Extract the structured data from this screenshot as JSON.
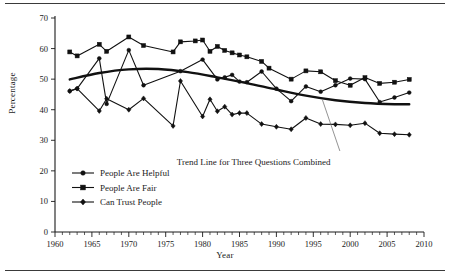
{
  "figure": {
    "rules": [
      "top-rule",
      "bottom-rule"
    ]
  },
  "chart_data": {
    "type": "line",
    "title": "",
    "xlabel": "Year",
    "ylabel": "Percentage",
    "xlim": [
      1960,
      2010
    ],
    "ylim": [
      0,
      70
    ],
    "xticks": [
      1960,
      1965,
      1970,
      1975,
      1980,
      1985,
      1990,
      1995,
      2000,
      2005,
      2010
    ],
    "xtick_labels": [
      "1960",
      "1965",
      "1970",
      "1975",
      "1980",
      "1985",
      "1990",
      "1995",
      "2000",
      "2005",
      "2010"
    ],
    "minor_xtick_step": 1,
    "yticks": [
      0,
      10,
      20,
      30,
      40,
      50,
      60,
      70
    ],
    "ytick_labels": [
      "0",
      "10",
      "20",
      "30",
      "40",
      "50",
      "60",
      "70"
    ],
    "grid": false,
    "legend_position": "lower-left-inside",
    "series": [
      {
        "name": "People Are Helpful",
        "marker": "circle",
        "x": [
          1962,
          1963,
          1966,
          1967,
          1970,
          1972,
          1977,
          1980,
          1982,
          1983,
          1984,
          1985,
          1986,
          1988,
          1990,
          1992,
          1994,
          1996,
          1998,
          2000,
          2002,
          2004,
          2006,
          2008
        ],
        "values": [
          46.1,
          46.9,
          56.8,
          41.9,
          59.5,
          48.0,
          52.6,
          56.4,
          49.9,
          50.6,
          51.4,
          49.2,
          49.0,
          52.5,
          46.9,
          42.8,
          47.6,
          45.9,
          48.0,
          50.2,
          50.0,
          42.5,
          44.0,
          45.6
        ]
      },
      {
        "name": "People Are Fair",
        "marker": "square",
        "x": [
          1962,
          1963,
          1966,
          1967,
          1970,
          1972,
          1976,
          1977,
          1979,
          1980,
          1981,
          1982,
          1983,
          1984,
          1985,
          1986,
          1988,
          1989,
          1992,
          1994,
          1996,
          1998,
          2000,
          2002,
          2004,
          2006,
          2008
        ],
        "values": [
          58.9,
          57.6,
          61.4,
          59.1,
          63.8,
          61.0,
          58.9,
          62.2,
          62.5,
          62.8,
          59.1,
          60.7,
          59.4,
          58.6,
          57.9,
          57.3,
          55.8,
          53.6,
          50.0,
          52.7,
          52.4,
          49.5,
          48.0,
          50.5,
          48.6,
          49.0,
          49.9
        ]
      },
      {
        "name": "Can Trust People",
        "marker": "diamond",
        "x": [
          1962,
          1963,
          1966,
          1967,
          1970,
          1972,
          1976,
          1977,
          1980,
          1981,
          1982,
          1983,
          1984,
          1985,
          1986,
          1988,
          1990,
          1992,
          1994,
          1996,
          1998,
          2000,
          2002,
          2004,
          2006,
          2008
        ],
        "values": [
          46.1,
          46.9,
          39.6,
          43.6,
          40.0,
          43.7,
          34.7,
          49.4,
          37.8,
          43.4,
          39.5,
          41.0,
          38.4,
          38.9,
          38.9,
          35.3,
          34.4,
          33.6,
          37.3,
          35.3,
          35.2,
          34.9,
          35.6,
          32.3,
          32.0,
          31.8
        ]
      }
    ],
    "trend_line": {
      "name": "Trend Line for Three Questions Combined",
      "annotation": "Trend Line for Three Questions Combined",
      "x": [
        1962,
        1966,
        1970,
        1974,
        1978,
        1982,
        1986,
        1990,
        1994,
        1998,
        2002,
        2006,
        2008
      ],
      "values": [
        49.9,
        52.0,
        53.2,
        53.3,
        52.3,
        50.6,
        48.7,
        46.6,
        44.6,
        43.1,
        42.2,
        41.8,
        41.8
      ]
    }
  },
  "legend": {
    "items": [
      {
        "label": "People Are Helpful",
        "marker": "circle"
      },
      {
        "label": "People Are Fair",
        "marker": "square"
      },
      {
        "label": "Can Trust People",
        "marker": "diamond"
      }
    ]
  }
}
